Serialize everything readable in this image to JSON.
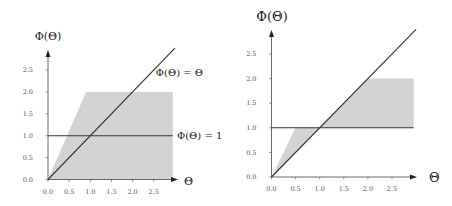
{
  "chart_data": [
    {
      "type": "area",
      "title": "",
      "xlabel": "Θ",
      "ylabel": "Φ(Θ)",
      "xlim": [
        0,
        3.0
      ],
      "ylim": [
        0,
        3.0
      ],
      "grid": false,
      "x_ticks": [
        0.0,
        0.5,
        1.0,
        1.5,
        2.0,
        2.5
      ],
      "x_tick_labels": [
        "0.0",
        "0.5",
        "1.0",
        "1.5",
        "2.0",
        "2.5"
      ],
      "y_ticks": [
        0.0,
        0.5,
        1.0,
        1.5,
        2.0,
        2.5
      ],
      "y_tick_labels": [
        "0.0",
        "0.5",
        "1.0",
        "1.5",
        "2.0",
        "2.5"
      ],
      "shaded_region": {
        "polygon": [
          [
            0,
            0
          ],
          [
            0.9,
            2.0
          ],
          [
            2.95,
            2.0
          ],
          [
            2.95,
            0
          ]
        ],
        "color": "#d3d3d3"
      },
      "series": [
        {
          "name": "Φ(Θ) = Θ",
          "points": [
            [
              0,
              0
            ],
            [
              3.0,
              3.0
            ]
          ],
          "color": "#333333"
        },
        {
          "name": "Φ(Θ) = 1",
          "points": [
            [
              0,
              1.0
            ],
            [
              2.95,
              1.0
            ]
          ],
          "color": "#333333"
        }
      ],
      "annotations": [
        {
          "text": "Φ(Θ) = Θ",
          "x": 2.55,
          "y": 2.45
        },
        {
          "text": "Φ(Θ) = 1",
          "x": 3.05,
          "y": 1.0
        }
      ]
    },
    {
      "type": "area",
      "title": "",
      "xlabel": "Θ",
      "ylabel": "Φ(Θ)",
      "xlim": [
        0,
        3.0
      ],
      "ylim": [
        0,
        3.0
      ],
      "grid": false,
      "x_ticks": [
        0.0,
        0.5,
        1.0,
        1.5,
        2.0,
        2.5
      ],
      "x_tick_labels": [
        "0.0",
        "0.5",
        "1.0",
        "1.5",
        "2.0",
        "2.5"
      ],
      "y_ticks": [
        0.0,
        0.5,
        1.0,
        1.5,
        2.0,
        2.5
      ],
      "y_tick_labels": [
        "0.0",
        "0.5",
        "1.0",
        "1.5",
        "2.0",
        "2.5"
      ],
      "shaded_regions": [
        {
          "polygon": [
            [
              0,
              0
            ],
            [
              0.5,
              1.0
            ],
            [
              1.0,
              1.0
            ]
          ],
          "color": "#d3d3d3"
        },
        {
          "polygon": [
            [
              1.0,
              1.0
            ],
            [
              2.0,
              2.0
            ],
            [
              2.95,
              2.0
            ],
            [
              2.95,
              1.0
            ]
          ],
          "color": "#d3d3d3"
        }
      ],
      "series": [
        {
          "name": "Φ(Θ) = Θ",
          "points": [
            [
              0,
              0
            ],
            [
              3.0,
              3.0
            ]
          ],
          "color": "#333333"
        },
        {
          "name": "Φ(Θ) = 1",
          "points": [
            [
              0,
              1.0
            ],
            [
              2.95,
              1.0
            ]
          ],
          "color": "#333333"
        }
      ],
      "annotations": []
    }
  ]
}
